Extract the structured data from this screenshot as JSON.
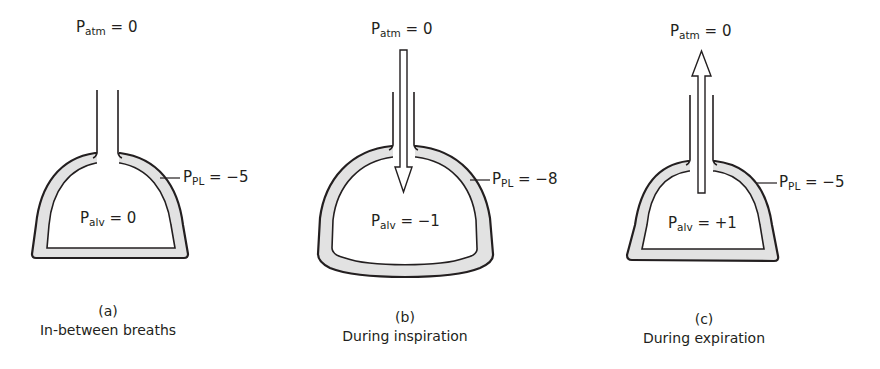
{
  "panels": [
    {
      "id": "a",
      "letter": "(a)",
      "caption": "In-between breaths",
      "flow": "none",
      "p_atm": {
        "symbol": "P",
        "sub": "atm",
        "value": "= 0"
      },
      "p_pl": {
        "symbol": "P",
        "sub": "PL",
        "value": "= −5"
      },
      "p_alv": {
        "symbol": "P",
        "sub": "alv",
        "value": "= 0"
      }
    },
    {
      "id": "b",
      "letter": "(b)",
      "caption": "During inspiration",
      "flow": "inward-arrow",
      "p_atm": {
        "symbol": "P",
        "sub": "atm",
        "value": "= 0"
      },
      "p_pl": {
        "symbol": "P",
        "sub": "PL",
        "value": "= −8"
      },
      "p_alv": {
        "symbol": "P",
        "sub": "alv",
        "value": "= −1"
      }
    },
    {
      "id": "c",
      "letter": "(c)",
      "caption": "During expiration",
      "flow": "outward-arrow",
      "p_atm": {
        "symbol": "P",
        "sub": "atm",
        "value": "= 0"
      },
      "p_pl": {
        "symbol": "P",
        "sub": "PL",
        "value": "= −5"
      },
      "p_alv": {
        "symbol": "P",
        "sub": "alv",
        "value": "= +1"
      }
    }
  ],
  "colors": {
    "stroke": "#231f20",
    "pleural_fill": "#e2e2e2",
    "background": "#ffffff"
  }
}
